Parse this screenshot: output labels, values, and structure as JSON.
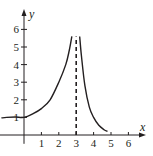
{
  "chart_data": {
    "type": "line",
    "title": "",
    "xlabel": "x",
    "ylabel": "y",
    "xlim": [
      -1.4,
      6.8
    ],
    "ylim": [
      -0.5,
      6.4
    ],
    "x_ticks": [
      "1",
      "2",
      "3",
      "4",
      "5",
      "6"
    ],
    "y_ticks": [
      "1",
      "2",
      "3",
      "4",
      "5",
      "6"
    ],
    "grid": false,
    "asymptote": {
      "x": 3,
      "style": "dashed"
    },
    "series": [
      {
        "name": "left-branch",
        "points": [
          [
            -1.3,
            0.97
          ],
          [
            -1.0,
            1.0
          ],
          [
            -0.5,
            1.02
          ],
          [
            0,
            1.0
          ],
          [
            0.5,
            1.2
          ],
          [
            1.0,
            1.5
          ],
          [
            1.5,
            2.0
          ],
          [
            2.0,
            3.0
          ],
          [
            2.4,
            4.0
          ],
          [
            2.6,
            4.8
          ],
          [
            2.75,
            5.6
          ]
        ]
      },
      {
        "name": "right-branch",
        "points": [
          [
            3.2,
            5.6
          ],
          [
            3.3,
            4.5
          ],
          [
            3.5,
            2.8
          ],
          [
            3.75,
            1.6
          ],
          [
            4.0,
            1.0
          ],
          [
            4.3,
            0.55
          ],
          [
            4.6,
            0.3
          ],
          [
            4.8,
            0.2
          ]
        ]
      }
    ],
    "colors": {
      "line": "#231f20",
      "axis": "#231f20"
    }
  }
}
